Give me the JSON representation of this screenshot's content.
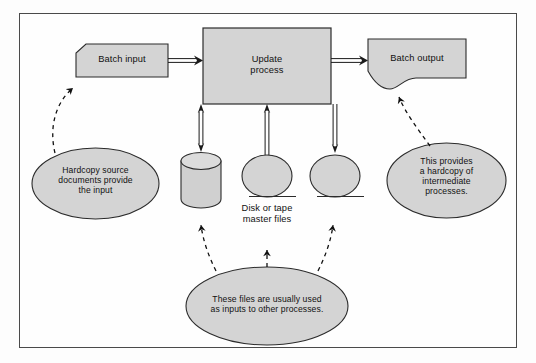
{
  "diagram": {
    "type": "system-flowchart",
    "colors": {
      "shape_fill": "#d4d4d4",
      "shape_stroke": "#2b2b2b",
      "frame_stroke": "#4a4a4a",
      "text": "#111111",
      "page_background": "#fdfdfd"
    },
    "nodes": [
      {
        "id": "batch-input",
        "label": "Batch input",
        "shape": "input-document",
        "x": 76,
        "y": 44,
        "w": 92,
        "h": 33
      },
      {
        "id": "update-process",
        "label": "Update\nprocess",
        "shape": "process-rectangle",
        "x": 203,
        "y": 28,
        "w": 128,
        "h": 76
      },
      {
        "id": "batch-output",
        "label": "Batch output",
        "shape": "output-document",
        "x": 368,
        "y": 39,
        "w": 98,
        "h": 45
      },
      {
        "id": "disk-store",
        "label": "",
        "shape": "cylinder-disk",
        "x": 181,
        "y": 153,
        "w": 40,
        "h": 53
      },
      {
        "id": "tape-store-1",
        "label": "",
        "shape": "tape-reel",
        "x": 242,
        "y": 155,
        "w": 50,
        "h": 42
      },
      {
        "id": "tape-store-2",
        "label": "",
        "shape": "tape-reel",
        "x": 310,
        "y": 155,
        "w": 50,
        "h": 42
      }
    ],
    "store_caption": "Disk or tape\nmaster files",
    "annotations": [
      {
        "id": "note-hardcopy-source",
        "text": "Hardcopy source\ndocuments provide\nthe input",
        "shape": "ellipse",
        "x": 32,
        "y": 148,
        "w": 127,
        "h": 71
      },
      {
        "id": "note-intermediate-hardcopy",
        "text": "This provides\na hardcopy of\nintermediate\nprocesses.",
        "shape": "ellipse",
        "x": 387,
        "y": 143,
        "w": 119,
        "h": 75
      },
      {
        "id": "note-files-reused",
        "text": "These files are usually used\nas inputs to other processes.",
        "shape": "ellipse",
        "x": 186,
        "y": 267,
        "w": 162,
        "h": 78
      }
    ],
    "connectors": [
      {
        "id": "flow-input-to-process",
        "style": "solid-open-arrow",
        "direction": "right",
        "from": "batch-input",
        "to": "update-process"
      },
      {
        "id": "flow-process-to-output",
        "style": "solid-open-arrow",
        "direction": "right",
        "from": "update-process",
        "to": "batch-output"
      },
      {
        "id": "flow-process-disk",
        "style": "solid-open-arrow",
        "direction": "bidirectional",
        "from": "update-process",
        "to": "disk-store"
      },
      {
        "id": "flow-tape1-to-process",
        "style": "solid-open-arrow",
        "direction": "up",
        "from": "tape-store-1",
        "to": "update-process"
      },
      {
        "id": "flow-process-to-tape2",
        "style": "solid-open-arrow",
        "direction": "down",
        "from": "update-process",
        "to": "tape-store-2"
      },
      {
        "id": "callout-source-to-input",
        "style": "dashed-arrow",
        "direction": "up",
        "from": "note-hardcopy-source",
        "to": "batch-input"
      },
      {
        "id": "callout-note-to-output",
        "style": "dashed-arrow",
        "direction": "up",
        "from": "note-intermediate-hardcopy",
        "to": "batch-output"
      },
      {
        "id": "callout-note-to-disk",
        "style": "dashed-arrow",
        "direction": "up",
        "from": "note-files-reused",
        "to": "disk-store"
      },
      {
        "id": "callout-note-to-tape1",
        "style": "dashed-arrow",
        "direction": "up",
        "from": "note-files-reused",
        "to": "tape-store-1"
      },
      {
        "id": "callout-note-to-tape2",
        "style": "dashed-arrow",
        "direction": "up",
        "from": "note-files-reused",
        "to": "tape-store-2"
      }
    ]
  }
}
